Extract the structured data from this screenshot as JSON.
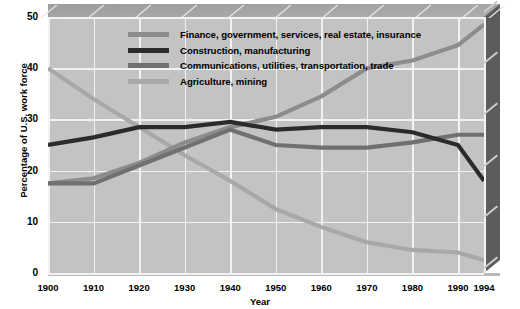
{
  "chart_data": {
    "type": "line",
    "title": "",
    "xlabel": "Year",
    "ylabel": "Percentage of U.S. work force",
    "xlim": [
      1900,
      1994
    ],
    "ylim": [
      0,
      50
    ],
    "grid": true,
    "legend_position": "top-center",
    "x": [
      1900,
      1910,
      1920,
      1930,
      1940,
      1950,
      1960,
      1970,
      1980,
      1990,
      1994
    ],
    "xtick_labels": [
      "1900",
      "1910",
      "1920",
      "1930",
      "1940",
      "1950",
      "1960",
      "1970",
      "1980",
      "1990",
      "1994"
    ],
    "ytick_labels": [
      "0",
      "10",
      "20",
      "30",
      "40",
      "50"
    ],
    "ytick_values": [
      0,
      10,
      20,
      30,
      40,
      50
    ],
    "series": [
      {
        "name": "Finance, government, services, real estate, insurance",
        "color": "#8c8c8c",
        "values": [
          17.5,
          18.5,
          21.5,
          25.5,
          28.5,
          30.5,
          34.5,
          40.0,
          41.5,
          44.5,
          48.5
        ]
      },
      {
        "name": "Construction, manufacturing",
        "color": "#2b2b2b",
        "values": [
          25.0,
          26.5,
          28.5,
          28.5,
          29.5,
          28.0,
          28.5,
          28.5,
          27.5,
          25.0,
          18.0
        ]
      },
      {
        "name": "Communications, utilities, transportation, trade",
        "color": "#707070",
        "values": [
          17.5,
          17.5,
          21.0,
          24.5,
          28.0,
          25.0,
          24.5,
          24.5,
          25.5,
          27.0,
          27.0
        ]
      },
      {
        "name": "Agriculture, mining",
        "color": "#a8a8a8",
        "values": [
          40.0,
          34.0,
          28.5,
          23.0,
          18.0,
          12.5,
          9.0,
          6.0,
          4.5,
          4.0,
          2.5
        ]
      }
    ]
  },
  "legend": {
    "items": [
      {
        "label": "Finance, government, services, real estate, insurance",
        "color": "#8c8c8c"
      },
      {
        "label": "Construction, manufacturing",
        "color": "#2b2b2b"
      },
      {
        "label": "Communications, utilities, transportation, trade",
        "color": "#707070"
      },
      {
        "label": "Agriculture, mining",
        "color": "#a8a8a8"
      }
    ]
  },
  "axes": {
    "x_title": "Year",
    "y_title": "Percentage of U.S. work force"
  }
}
